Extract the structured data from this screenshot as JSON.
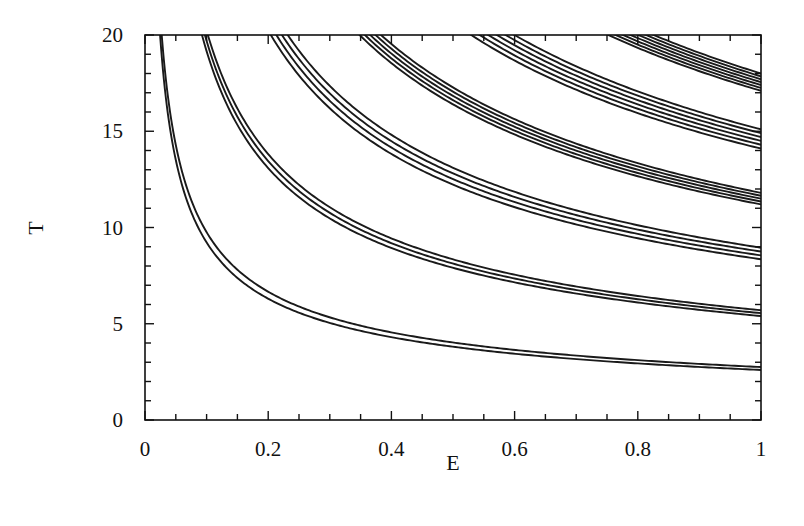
{
  "chart_data": {
    "type": "line",
    "title": "",
    "xlabel": "E",
    "ylabel": "T",
    "xlim": [
      0,
      1
    ],
    "ylim": [
      0,
      20
    ],
    "grid": false,
    "legend": null,
    "x_ticks": [
      0,
      0.2,
      0.4,
      0.6,
      0.8,
      1
    ],
    "x_tick_labels": [
      "0",
      "0.2",
      "0.4",
      "0.6",
      "0.8",
      "1"
    ],
    "x_minor_step": 0.05,
    "y_ticks": [
      0,
      5,
      10,
      15,
      20
    ],
    "y_tick_labels": [
      "0",
      "5",
      "10",
      "15",
      "20"
    ],
    "y_minor_step": 1,
    "functional_form": "T = T_at_E1 * E^(-0.55)",
    "bands": [
      {
        "name": "band-1",
        "curves_T_at_E1": [
          2.6,
          2.75
        ]
      },
      {
        "name": "band-2",
        "curves_T_at_E1": [
          5.4,
          5.55,
          5.7
        ]
      },
      {
        "name": "band-3",
        "curves_T_at_E1": [
          8.35,
          8.55,
          8.75,
          8.95
        ]
      },
      {
        "name": "band-4",
        "curves_T_at_E1": [
          11.2,
          11.35,
          11.5,
          11.65,
          11.8
        ]
      },
      {
        "name": "band-5",
        "curves_T_at_E1": [
          14.1,
          14.3,
          14.5,
          14.7,
          14.9,
          15.1
        ]
      },
      {
        "name": "band-6",
        "curves_T_at_E1": [
          17.1,
          17.25,
          17.4,
          17.55,
          17.7,
          17.85,
          18.0
        ]
      }
    ],
    "sample_points": {
      "band-1": {
        "E": [
          0.025,
          0.1,
          0.2,
          0.4,
          0.6,
          0.8,
          1.0
        ],
        "T": [
          20,
          9.4,
          6.3,
          4.6,
          3.6,
          3.1,
          2.7
        ]
      },
      "band-2": {
        "E": [
          0.09,
          0.2,
          0.4,
          0.6,
          0.8,
          1.0
        ],
        "T": [
          20,
          13.0,
          9.0,
          7.2,
          6.3,
          5.6
        ]
      },
      "band-3": {
        "E": [
          0.2,
          0.4,
          0.6,
          0.8,
          1.0
        ],
        "T": [
          20,
          14.0,
          11.2,
          9.7,
          8.6
        ]
      },
      "band-4": {
        "E": [
          0.34,
          0.4,
          0.6,
          0.8,
          1.0
        ],
        "T": [
          20,
          19.0,
          15.2,
          13.1,
          11.5
        ]
      },
      "band-5": {
        "E": [
          0.53,
          0.6,
          0.8,
          1.0
        ],
        "T": [
          20,
          19.1,
          16.4,
          14.6
        ]
      },
      "band-6": {
        "E": [
          0.75,
          0.8,
          1.0
        ],
        "T": [
          20,
          19.7,
          17.5
        ]
      }
    }
  }
}
